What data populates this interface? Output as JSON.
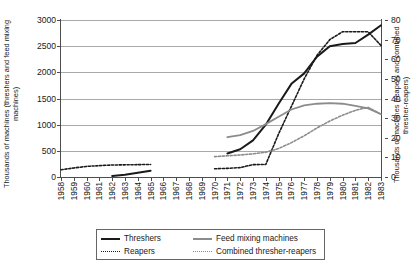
{
  "chart_data": {
    "type": "line",
    "title": "",
    "subtitle": "",
    "xlabel": "",
    "ylabel": "Thousands of machines (threshers and feed mixing machines)",
    "y2label": "Thousands of machines (reapers and combined thresher-reapers)",
    "grid": true,
    "legend_position": "bottom",
    "x": [
      1958,
      1959,
      1960,
      1961,
      1962,
      1963,
      1964,
      1965,
      1966,
      1967,
      1968,
      1969,
      1970,
      1971,
      1972,
      1973,
      1974,
      1975,
      1976,
      1977,
      1978,
      1979,
      1980,
      1981,
      1982,
      1983
    ],
    "xtick_labels": [
      "1958",
      "1959",
      "1960",
      "1961",
      "1962",
      "1963",
      "1964",
      "1965",
      "1966",
      "1967",
      "1968",
      "1969",
      "1970",
      "1971",
      "1972",
      "1973",
      "1974",
      "1975",
      "1976",
      "1977",
      "1978",
      "1979",
      "1980",
      "1981",
      "1982",
      "1983"
    ],
    "ylim": [
      0,
      3000
    ],
    "ytick_labels": [
      "0",
      "500",
      "1000",
      "1500",
      "2000",
      "2500",
      "3000"
    ],
    "ytick_values": [
      0,
      500,
      1000,
      1500,
      2000,
      2500,
      3000
    ],
    "y2lim": [
      0,
      80
    ],
    "y2tick_labels": [
      "0",
      "10",
      "20",
      "30",
      "40",
      "50",
      "60",
      "70",
      "80"
    ],
    "y2tick_values": [
      0,
      10,
      20,
      30,
      40,
      50,
      60,
      70,
      80
    ],
    "series": [
      {
        "name": "Threshers",
        "axis": "left",
        "color": "#1a1a1a",
        "style": "solid",
        "width": 2.0,
        "points": [
          {
            "x": 1962,
            "y": 20
          },
          {
            "x": 1963,
            "y": 45
          },
          {
            "x": 1964,
            "y": 80
          },
          {
            "x": 1965,
            "y": 120
          },
          {
            "x": 1971,
            "y": 450
          },
          {
            "x": 1972,
            "y": 530
          },
          {
            "x": 1973,
            "y": 700
          },
          {
            "x": 1974,
            "y": 1000
          },
          {
            "x": 1975,
            "y": 1400
          },
          {
            "x": 1976,
            "y": 1780
          },
          {
            "x": 1977,
            "y": 1980
          },
          {
            "x": 1978,
            "y": 2300
          },
          {
            "x": 1979,
            "y": 2500
          },
          {
            "x": 1980,
            "y": 2540
          },
          {
            "x": 1981,
            "y": 2560
          },
          {
            "x": 1982,
            "y": 2720
          },
          {
            "x": 1983,
            "y": 2900
          }
        ]
      },
      {
        "name": "Reapers",
        "axis": "right",
        "color": "#1a1a1a",
        "style": "dotted",
        "width": 1.6,
        "points": [
          {
            "x": 1958,
            "y": 3.7
          },
          {
            "x": 1959,
            "y": 4.6
          },
          {
            "x": 1960,
            "y": 5.4
          },
          {
            "x": 1961,
            "y": 5.8
          },
          {
            "x": 1962,
            "y": 6.1
          },
          {
            "x": 1963,
            "y": 6.2
          },
          {
            "x": 1964,
            "y": 6.3
          },
          {
            "x": 1965,
            "y": 6.4
          },
          {
            "x": 1970,
            "y": 4.2
          },
          {
            "x": 1971,
            "y": 4.4
          },
          {
            "x": 1972,
            "y": 4.8
          },
          {
            "x": 1973,
            "y": 6.3
          },
          {
            "x": 1974,
            "y": 6.4
          },
          {
            "x": 1975,
            "y": 22
          },
          {
            "x": 1976,
            "y": 36
          },
          {
            "x": 1977,
            "y": 50
          },
          {
            "x": 1978,
            "y": 62
          },
          {
            "x": 1979,
            "y": 70
          },
          {
            "x": 1980,
            "y": 74
          },
          {
            "x": 1981,
            "y": 74
          },
          {
            "x": 1982,
            "y": 74
          },
          {
            "x": 1983,
            "y": 67
          }
        ]
      },
      {
        "name": "Feed mixing machines",
        "axis": "left",
        "color": "#8c8c8c",
        "style": "solid",
        "width": 1.8,
        "points": [
          {
            "x": 1971,
            "y": 760
          },
          {
            "x": 1972,
            "y": 800
          },
          {
            "x": 1973,
            "y": 880
          },
          {
            "x": 1974,
            "y": 1010
          },
          {
            "x": 1975,
            "y": 1150
          },
          {
            "x": 1976,
            "y": 1290
          },
          {
            "x": 1977,
            "y": 1370
          },
          {
            "x": 1978,
            "y": 1400
          },
          {
            "x": 1979,
            "y": 1410
          },
          {
            "x": 1980,
            "y": 1400
          },
          {
            "x": 1981,
            "y": 1360
          },
          {
            "x": 1982,
            "y": 1310
          },
          {
            "x": 1983,
            "y": 1200
          }
        ]
      },
      {
        "name": "Combined thresher-reapers",
        "axis": "right",
        "color": "#8c8c8c",
        "style": "dotted",
        "width": 1.6,
        "points": [
          {
            "x": 1970,
            "y": 10.4
          },
          {
            "x": 1971,
            "y": 10.8
          },
          {
            "x": 1972,
            "y": 11.2
          },
          {
            "x": 1973,
            "y": 11.8
          },
          {
            "x": 1974,
            "y": 12.6
          },
          {
            "x": 1975,
            "y": 14.5
          },
          {
            "x": 1976,
            "y": 17.5
          },
          {
            "x": 1977,
            "y": 21
          },
          {
            "x": 1978,
            "y": 25
          },
          {
            "x": 1979,
            "y": 28.5
          },
          {
            "x": 1980,
            "y": 31.5
          },
          {
            "x": 1981,
            "y": 34
          },
          {
            "x": 1982,
            "y": 35.5
          },
          {
            "x": 1983,
            "y": 32
          }
        ]
      }
    ],
    "legend": [
      {
        "label": "Threshers",
        "color": "#1a1a1a",
        "style": "solid"
      },
      {
        "label": "Feed mixing machines",
        "color": "#8c8c8c",
        "style": "solid"
      },
      {
        "label": "Reapers",
        "color": "#1a1a1a",
        "style": "dotted"
      },
      {
        "label": "Combined thresher-reapers",
        "color": "#8c8c8c",
        "style": "dotted"
      }
    ]
  }
}
